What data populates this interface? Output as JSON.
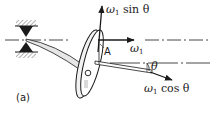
{
  "figure": {
    "panel_label": "(a)",
    "point_label": "A",
    "pivot_label": "O",
    "angle_label": "θ"
  },
  "vectors": {
    "vertical": {
      "symbol": "ω",
      "subscript": "1",
      "suffix": " sin θ"
    },
    "horizontal": {
      "symbol": "ω",
      "subscript": "1",
      "suffix": ""
    },
    "axle": {
      "symbol": "ω",
      "subscript": "1",
      "suffix": " cos θ"
    }
  },
  "colors": {
    "ink": "#1a1a1a",
    "background": "#ffffff",
    "hatch": "#555555"
  }
}
